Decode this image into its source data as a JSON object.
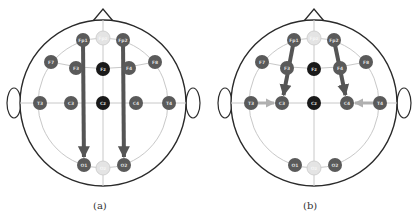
{
  "panels": [
    {
      "id": "a",
      "caption": "(a)",
      "center": [
        103,
        103
      ],
      "arrows": [
        {
          "from": "Fp1",
          "to": "O1",
          "style": "dark-long"
        },
        {
          "from": "Fp2",
          "to": "O2",
          "style": "dark-long"
        }
      ]
    },
    {
      "id": "b",
      "caption": "(b)",
      "center": [
        314,
        103
      ],
      "arrows": [
        {
          "from": "Fp1",
          "to": "C3",
          "style": "dark"
        },
        {
          "from": "Fp2",
          "to": "C4",
          "style": "dark"
        },
        {
          "from": "T3",
          "to": "C3",
          "style": "light"
        },
        {
          "from": "T4",
          "to": "C4",
          "style": "light"
        }
      ]
    }
  ],
  "electrodes": [
    {
      "label": "Fpz",
      "dx": 0,
      "dy": -65,
      "type": "reference"
    },
    {
      "label": "Fp1",
      "dx": -20,
      "dy": -63,
      "type": "lateral"
    },
    {
      "label": "Fp2",
      "dx": 20,
      "dy": -63,
      "type": "lateral"
    },
    {
      "label": "F7",
      "dx": -52,
      "dy": -41,
      "type": "lateral"
    },
    {
      "label": "F3",
      "dx": -27,
      "dy": -35,
      "type": "lateral"
    },
    {
      "label": "Fz",
      "dx": 0,
      "dy": -34,
      "type": "midline"
    },
    {
      "label": "F4",
      "dx": 26,
      "dy": -35,
      "type": "lateral"
    },
    {
      "label": "F8",
      "dx": 52,
      "dy": -41,
      "type": "lateral"
    },
    {
      "label": "T3",
      "dx": -63,
      "dy": 0,
      "type": "lateral"
    },
    {
      "label": "C3",
      "dx": -32,
      "dy": 0,
      "type": "lateral"
    },
    {
      "label": "Cz",
      "dx": 0,
      "dy": 0,
      "type": "midline"
    },
    {
      "label": "C4",
      "dx": 33,
      "dy": 0,
      "type": "lateral"
    },
    {
      "label": "T4",
      "dx": 66,
      "dy": 0,
      "type": "lateral"
    },
    {
      "label": "O1",
      "dx": -19,
      "dy": 62,
      "type": "lateral"
    },
    {
      "label": "Oz",
      "dx": 0,
      "dy": 65,
      "type": "reference"
    },
    {
      "label": "O2",
      "dx": 21,
      "dy": 62,
      "type": "lateral"
    }
  ],
  "colors": {
    "head_outline": "#2a2a2a",
    "grid_line": "#c8c8c8",
    "electrode_lateral": "#5a5a5a",
    "electrode_midline": "#1a1a1a",
    "electrode_reference": "#e4e4e4",
    "electrode_text": "#dddddd",
    "arrow_dark": "#555555",
    "arrow_light": "#b0b0b0"
  }
}
